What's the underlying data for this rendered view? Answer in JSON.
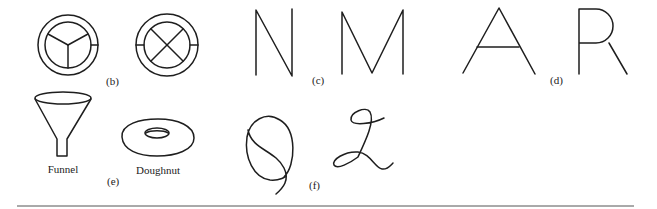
{
  "figure": {
    "panels": [
      {
        "id": "b",
        "label": "(b)",
        "content": [
          "circle with three-way divider",
          "circle with X divider"
        ]
      },
      {
        "id": "c",
        "label": "(c)",
        "content": [
          "letter N",
          "letter M"
        ]
      },
      {
        "id": "d",
        "label": "(d)",
        "content": [
          "letter A",
          "letter R"
        ]
      },
      {
        "id": "e",
        "label": "(e)",
        "content": [
          "Funnel",
          "Doughnut"
        ]
      },
      {
        "id": "f",
        "label": "(f)",
        "content": [
          "cursive Q",
          "cursive Z"
        ]
      }
    ],
    "captions": {
      "funnel": "Funnel",
      "doughnut": "Doughnut"
    },
    "colors": {
      "ink": "#1e1e1e",
      "background": "#ffffff",
      "rule": "#555555"
    }
  }
}
